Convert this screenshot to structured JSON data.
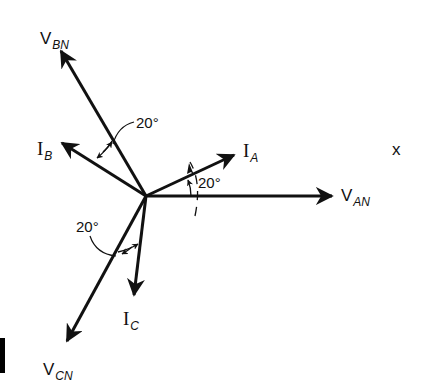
{
  "diagram": {
    "type": "phasor-diagram",
    "origin": {
      "x": 146,
      "y": 196
    },
    "colors": {
      "ink": "#111111",
      "background": "#ffffff"
    },
    "phasors": [
      {
        "id": "V_AN",
        "label_main": "V",
        "label_sub": "AN",
        "kind": "voltage",
        "angle_deg": 0
      },
      {
        "id": "I_A",
        "label_main": "I",
        "label_sub": "A",
        "kind": "current",
        "angle_deg": 20
      },
      {
        "id": "V_BN",
        "label_main": "V",
        "label_sub": "BN",
        "kind": "voltage",
        "angle_deg": 120
      },
      {
        "id": "I_B",
        "label_main": "I",
        "label_sub": "B",
        "kind": "current",
        "angle_deg": 140
      },
      {
        "id": "V_CN",
        "label_main": "V",
        "label_sub": "CN",
        "kind": "voltage",
        "angle_deg": 240
      },
      {
        "id": "I_C",
        "label_main": "I",
        "label_sub": "C",
        "kind": "current",
        "angle_deg": 260
      }
    ],
    "angle_labels": {
      "a": "20°",
      "b": "20°",
      "c": "20°"
    },
    "rotation_label": "x"
  }
}
